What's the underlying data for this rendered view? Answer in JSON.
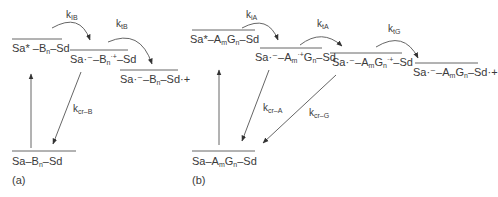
{
  "panel_a": {
    "tag": "(a)",
    "states": {
      "excited": {
        "main": "Sa* –B",
        "sub": "n",
        "tail": "–Sd"
      },
      "cs1": {
        "pre": "Sa·⁻–B",
        "sub": "n",
        "sup": "·+",
        "tail": "–Sd"
      },
      "cs2": {
        "pre": "Sa·⁻–B",
        "sub": "n",
        "tail": "–Sd·+"
      },
      "ground": {
        "pre": "Sa–B",
        "sub": "n",
        "tail": "–Sd"
      }
    },
    "rates": {
      "k1": {
        "k": "k",
        "sub": "IB"
      },
      "k2": {
        "k": "k",
        "sub": "tB"
      },
      "k3": {
        "k": "k",
        "sub": "cr–B"
      }
    }
  },
  "panel_b": {
    "tag": "(b)",
    "states": {
      "excited": {
        "pre": "Sa*–A",
        "sub1": "m",
        "mid": "G",
        "sub2": "n",
        "tail": "–Sd"
      },
      "cs1": {
        "pre": "Sa·⁻–A",
        "sub1": "m",
        "sup1": "·+",
        "mid": "G",
        "sub2": "n",
        "tail": "–Sd"
      },
      "cs2": {
        "pre": "Sa·⁻–A",
        "sub1": "m",
        "mid": "G",
        "sub2": "n",
        "sup2": "·+",
        "tail": "–Sd"
      },
      "cs3": {
        "pre": "Sa·⁻–A",
        "sub1": "m",
        "mid": "G",
        "sub2": "n",
        "tail": "–Sd·+"
      },
      "ground": {
        "pre": "Sa–A",
        "sub1": "m",
        "mid": "G",
        "sub2": "n",
        "tail": "–Sd"
      }
    },
    "rates": {
      "k1": {
        "k": "k",
        "sub": "iA"
      },
      "k2": {
        "k": "k",
        "sub": "tA"
      },
      "k3": {
        "k": "k",
        "sub": "tG"
      },
      "k4": {
        "k": "k",
        "sub": "cr–A"
      },
      "k5": {
        "k": "k",
        "sub": "cr–G"
      }
    }
  },
  "colors": {
    "line": "#555555",
    "text": "#3a3a3a"
  }
}
